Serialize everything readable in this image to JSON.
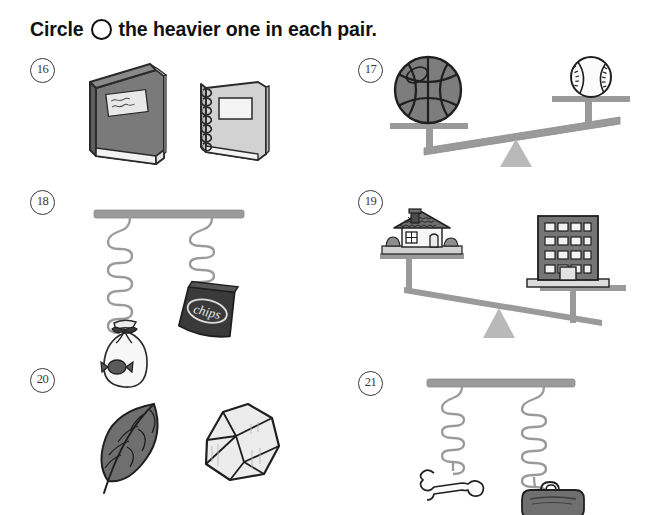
{
  "worksheet": {
    "instruction_pre": "Circle",
    "instruction_post": "the heavier one in each pair.",
    "circle_icon": "circle-outline-icon"
  },
  "colors": {
    "ink": "#1a1a1a",
    "outline": "#2b2b2b",
    "dark_gray": "#6f6f6f",
    "mid_gray": "#9a9a9a",
    "light_gray": "#d9d9d9",
    "pale_gray": "#efefef",
    "beam_gray": "#8d8d8d",
    "fulcrum_gray": "#b5b5b5"
  },
  "items": [
    {
      "number": "16",
      "type": "object-pair",
      "left": {
        "name": "hardcover-book",
        "label": "",
        "fill": "dark"
      },
      "right": {
        "name": "spiral-notebook",
        "label": "",
        "fill": "light"
      }
    },
    {
      "number": "17",
      "type": "seesaw-balance",
      "left": {
        "name": "basketball",
        "position": "down",
        "fill": "dark"
      },
      "right": {
        "name": "baseball",
        "position": "up",
        "fill": "light"
      },
      "tilt": "left-down"
    },
    {
      "number": "18",
      "type": "spring-scale",
      "left": {
        "name": "candy-bag",
        "spring_length": "long",
        "fill": "light"
      },
      "right": {
        "name": "chip-bag",
        "label": "chips",
        "spring_length": "short",
        "fill": "dark"
      }
    },
    {
      "number": "19",
      "type": "seesaw-balance",
      "left": {
        "name": "house",
        "position": "up",
        "fill": "mixed"
      },
      "right": {
        "name": "apartment-building",
        "position": "down",
        "fill": "dark"
      },
      "tilt": "right-down"
    },
    {
      "number": "20",
      "type": "object-pair",
      "left": {
        "name": "leaf",
        "fill": "dark"
      },
      "right": {
        "name": "rock",
        "fill": "light"
      }
    },
    {
      "number": "21",
      "type": "spring-scale",
      "left": {
        "name": "bone",
        "spring_length": "short",
        "fill": "light"
      },
      "right": {
        "name": "duffel-bag",
        "spring_length": "long",
        "fill": "dark"
      }
    }
  ]
}
